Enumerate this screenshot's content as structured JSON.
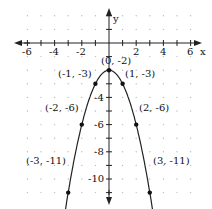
{
  "chart_data": {
    "type": "line",
    "title": "",
    "xlabel": "x",
    "ylabel": "y",
    "xlim": [
      -6.5,
      6.5
    ],
    "ylim": [
      -14,
      2.5
    ],
    "grid": "dotted",
    "x_ticks": [
      -6,
      -4,
      -2,
      2,
      4,
      6
    ],
    "y_ticks": [
      -4,
      -6,
      -8,
      -10,
      -12
    ],
    "y_tick_labels": [
      "-4",
      "-6",
      "-8",
      "-10",
      "-12"
    ],
    "x_tick_labels": [
      "-6",
      "-4",
      "-2",
      "2",
      "4",
      "6"
    ],
    "function": "y = -x^2 - 2",
    "series": [
      {
        "name": "parabola",
        "points": [
          {
            "x": -3,
            "y": -11,
            "label": "(-3, -11)"
          },
          {
            "x": -2,
            "y": -6,
            "label": "(-2, -6)"
          },
          {
            "x": -1,
            "y": -3,
            "label": "(-1, -3)"
          },
          {
            "x": 0,
            "y": -2,
            "label": "(0, -2)"
          },
          {
            "x": 1,
            "y": -3,
            "label": "(1, -3)"
          },
          {
            "x": 2,
            "y": -6,
            "label": "(2, -6)"
          },
          {
            "x": 3,
            "y": -11,
            "label": "(3, -11)"
          }
        ]
      }
    ]
  },
  "labels": {
    "x_axis": "x",
    "y_axis": "y",
    "p_m3": "(-3, -11)",
    "p_m2": "(-2, -6)",
    "p_m1": "(-1, -3)",
    "p_0": "(0, -2)",
    "p_1": "(1, -3)",
    "p_2": "(2, -6)",
    "p_3": "(3, -11)",
    "xt_m6": "-6",
    "xt_m4": "-4",
    "xt_m2": "-2",
    "xt_2": "2",
    "xt_4": "4",
    "xt_6": "6",
    "yt_m4": "-4",
    "yt_m6": "-6",
    "yt_m8": "-8",
    "yt_m10": "-10",
    "yt_m12": "-12"
  }
}
